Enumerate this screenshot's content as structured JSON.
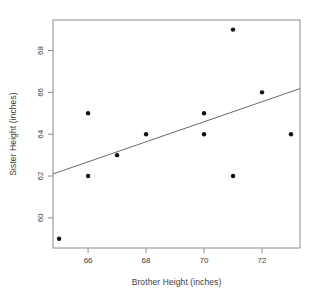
{
  "chart_data": {
    "type": "scatter",
    "title": "",
    "xlabel": "Brother Height (inches)",
    "ylabel": "Sister Height (inches)",
    "x_ticks": [
      66,
      68,
      70,
      72
    ],
    "y_ticks": [
      60,
      62,
      64,
      66,
      68
    ],
    "xlim": [
      64.79,
      73.31
    ],
    "ylim": [
      58.56,
      69.46
    ],
    "grid": false,
    "legend_position": "none",
    "points": [
      {
        "x": 65,
        "y": 59
      },
      {
        "x": 66,
        "y": 62
      },
      {
        "x": 66,
        "y": 65
      },
      {
        "x": 67,
        "y": 63
      },
      {
        "x": 68,
        "y": 64
      },
      {
        "x": 70,
        "y": 64
      },
      {
        "x": 70,
        "y": 65
      },
      {
        "x": 71,
        "y": 62
      },
      {
        "x": 71,
        "y": 69
      },
      {
        "x": 72,
        "y": 66
      },
      {
        "x": 73,
        "y": 64
      }
    ],
    "regression_line": {
      "x1": 64.79,
      "y1": 62.1,
      "x2": 73.31,
      "y2": 66.18
    },
    "colors": {
      "point": "#111111",
      "line": "#6a6a6a",
      "box": "#8c8c8c",
      "tick": "#8c8c8c",
      "text": "#3d3d3d",
      "background": "#ffffff"
    }
  }
}
